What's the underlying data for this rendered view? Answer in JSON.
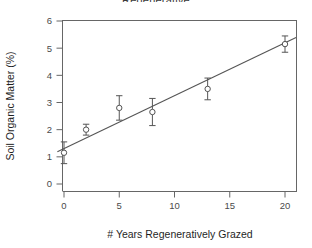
{
  "figure": {
    "title_partial": "Regenerative",
    "background": "#ffffff",
    "foreground": "#555555",
    "axis_text_color": "#4a4a4a",
    "axis_title_color": "#1f1f1f"
  },
  "chart_data": {
    "type": "scatter",
    "title": "",
    "xlabel": "# Years Regeneratively Grazed",
    "ylabel": "Soil Organic Matter (%)",
    "xlim": [
      -1.2,
      21.5
    ],
    "ylim": [
      -0.35,
      6.4
    ],
    "xticks": [
      0,
      5,
      10,
      15,
      20
    ],
    "xtick_labels": [
      "0",
      "5",
      "10",
      "15",
      "20"
    ],
    "yticks": [
      0,
      1,
      2,
      3,
      4,
      5,
      6
    ],
    "ytick_labels": [
      "0",
      "1",
      "2",
      "3",
      "4",
      "5",
      "6"
    ],
    "grid": false,
    "legend": null,
    "marker": "open-circle",
    "x": [
      0,
      2,
      5,
      8,
      13,
      20
    ],
    "y": [
      1.15,
      2.0,
      2.8,
      2.65,
      3.5,
      5.15
    ],
    "yerr": [
      0.4,
      0.2,
      0.45,
      0.5,
      0.4,
      0.3
    ],
    "series": [
      {
        "name": "Soil organic matter observations",
        "points": [
          {
            "x": 0,
            "y": 1.15,
            "err": 0.4
          },
          {
            "x": 2,
            "y": 2.0,
            "err": 0.2
          },
          {
            "x": 5,
            "y": 2.8,
            "err": 0.45
          },
          {
            "x": 8,
            "y": 2.65,
            "err": 0.5
          },
          {
            "x": 13,
            "y": 3.5,
            "err": 0.4
          },
          {
            "x": 20,
            "y": 5.15,
            "err": 0.3
          }
        ]
      }
    ],
    "fit_line": {
      "type": "linear",
      "intercept": 1.3,
      "slope": 0.195,
      "x_start": -0.6,
      "x_end": 21.0,
      "y_start": 1.18,
      "y_end": 5.4
    }
  }
}
